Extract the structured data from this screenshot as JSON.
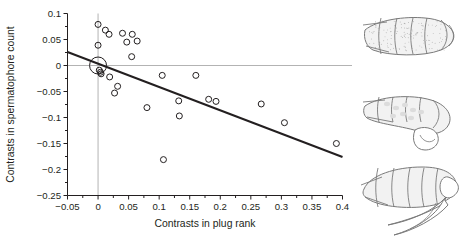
{
  "figure": {
    "name": "contrasts-scatterplot-with-insect-illustrations",
    "background_color": "#ffffff"
  },
  "chart_data": {
    "type": "scatter",
    "title": "",
    "subtitle": "",
    "xlabel": "Contrasts in plug rank",
    "ylabel": "Contrasts in spermatophore count",
    "xlim": [
      -0.05,
      0.4
    ],
    "ylim": [
      -0.25,
      0.1
    ],
    "xticks": [
      -0.05,
      0,
      0.05,
      0.1,
      0.15,
      0.2,
      0.25,
      0.3,
      0.35,
      0.4
    ],
    "xtick_labels": [
      "−0.05",
      "0",
      "0.05",
      "0.1",
      "0.15",
      "0.2",
      "0.25",
      "0.3",
      "0.35",
      "0.4"
    ],
    "yticks": [
      0.1,
      0.05,
      0,
      -0.05,
      -0.1,
      -0.15,
      -0.2,
      -0.25
    ],
    "ytick_labels": [
      "0.1",
      "0.05",
      "0",
      "−0.05",
      "−0.1",
      "−0.15",
      "−0.2",
      "−0.25"
    ],
    "x_minor_tick_step": 0.025,
    "grid": false,
    "legend": null,
    "reference_lines": [
      {
        "name": "zero-horizontal-reference",
        "orientation": "horizontal",
        "value": 0,
        "color": "#b3b3b3"
      },
      {
        "name": "zero-vertical-reference",
        "orientation": "vertical",
        "value": 0,
        "color": "#b3b3b3"
      }
    ],
    "marker": {
      "shape": "open-circle",
      "edge_color": "#231f20",
      "face_color": "none",
      "size": 5
    },
    "points": [
      {
        "x": 0.0,
        "y": 0.079
      },
      {
        "x": 0.0,
        "y": 0.039
      },
      {
        "x": 0.012,
        "y": 0.068
      },
      {
        "x": 0.018,
        "y": 0.06
      },
      {
        "x": 0.04,
        "y": 0.062
      },
      {
        "x": 0.047,
        "y": 0.045
      },
      {
        "x": 0.056,
        "y": 0.06
      },
      {
        "x": 0.064,
        "y": 0.047
      },
      {
        "x": 0.055,
        "y": 0.017
      },
      {
        "x": 0.0,
        "y": 0.0,
        "large": true
      },
      {
        "x": 0.002,
        "y": -0.009
      },
      {
        "x": 0.004,
        "y": -0.013
      },
      {
        "x": 0.005,
        "y": -0.016
      },
      {
        "x": 0.019,
        "y": -0.022
      },
      {
        "x": 0.032,
        "y": -0.04
      },
      {
        "x": 0.027,
        "y": -0.053
      },
      {
        "x": 0.08,
        "y": -0.081
      },
      {
        "x": 0.107,
        "y": -0.181
      },
      {
        "x": 0.105,
        "y": -0.019
      },
      {
        "x": 0.132,
        "y": -0.068
      },
      {
        "x": 0.133,
        "y": -0.097
      },
      {
        "x": 0.16,
        "y": -0.019
      },
      {
        "x": 0.181,
        "y": -0.065
      },
      {
        "x": 0.193,
        "y": -0.069
      },
      {
        "x": 0.267,
        "y": -0.074
      },
      {
        "x": 0.305,
        "y": -0.11
      },
      {
        "x": 0.39,
        "y": -0.15
      }
    ],
    "trendline": {
      "name": "regression-line",
      "x1": -0.05,
      "y1": 0.026,
      "x2": 0.4,
      "y2": -0.176,
      "color": "#231f20",
      "width": 2
    }
  },
  "illustrations": [
    {
      "name": "insect-abdomen-top",
      "caption": ""
    },
    {
      "name": "insect-abdomen-middle",
      "caption": ""
    },
    {
      "name": "insect-abdomen-bottom",
      "caption": ""
    }
  ]
}
